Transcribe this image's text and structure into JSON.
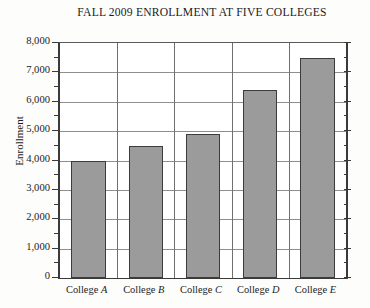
{
  "chart_data": {
    "type": "bar",
    "title": "FALL 2009 ENROLLMENT AT FIVE COLLEGES",
    "xlabel": "",
    "ylabel": "Enrollment",
    "categories": [
      "College A",
      "College B",
      "College C",
      "College D",
      "College E"
    ],
    "category_prefix": "College",
    "category_letters": [
      "A",
      "B",
      "C",
      "D",
      "E"
    ],
    "values": [
      4000,
      4500,
      4900,
      6400,
      7500
    ],
    "ylim": [
      0,
      8000
    ],
    "ytick_step": 1000,
    "yminor_step": 500,
    "ytick_labels": [
      "0",
      "1,000",
      "2,000",
      "3,000",
      "4,000",
      "5,000",
      "6,000",
      "7,000",
      "8,000"
    ],
    "ytick_values": [
      0,
      1000,
      2000,
      3000,
      4000,
      5000,
      6000,
      7000,
      8000
    ],
    "grid": true,
    "grid_axis": "y",
    "legend": false,
    "legend_position": "none",
    "bar_color": "#9b9b9b",
    "bar_edge_color": "#3c3c3c",
    "grid_color": "#8e8e8e",
    "axis_color": "#3a3a3a",
    "background_color": "#ffffff",
    "page_background_color": "#fdfdfc"
  }
}
